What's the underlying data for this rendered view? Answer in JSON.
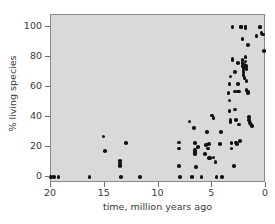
{
  "chart_data": {
    "type": "scatter",
    "title": "",
    "xlabel": "time, million years ago",
    "ylabel": "% living species",
    "xlim": [
      20,
      0
    ],
    "ylim": [
      -4,
      108
    ],
    "x_reversed": true,
    "grid": false,
    "legend": "none",
    "xticks": [
      20,
      15,
      10,
      5,
      0
    ],
    "yticks": [
      0,
      20,
      40,
      60,
      80,
      100
    ],
    "xtick_labels": [
      "20",
      "15",
      "10",
      "5",
      "0"
    ],
    "ytick_labels": [
      "0",
      "20",
      "40",
      "60",
      "80",
      "100"
    ],
    "marker": "filled-circle",
    "marker_color": "#111111",
    "plot_background": "#d9d9d9",
    "figure_background": "#ffffff",
    "points": [
      [
        20.0,
        0
      ],
      [
        19.7,
        0
      ],
      [
        19.3,
        0
      ],
      [
        16.4,
        0
      ],
      [
        15.1,
        27
      ],
      [
        15.0,
        17.5
      ],
      [
        13.6,
        10.5
      ],
      [
        13.6,
        9.0
      ],
      [
        13.6,
        7.5
      ],
      [
        13.5,
        0
      ],
      [
        13.0,
        22.5
      ],
      [
        11.7,
        0
      ],
      [
        8.1,
        23
      ],
      [
        8.1,
        19
      ],
      [
        8.1,
        7.5
      ],
      [
        8.0,
        0
      ],
      [
        7.1,
        37
      ],
      [
        6.9,
        0
      ],
      [
        6.7,
        32.5
      ],
      [
        6.6,
        22.5
      ],
      [
        6.6,
        18
      ],
      [
        6.6,
        16.5
      ],
      [
        6.6,
        15.5
      ],
      [
        6.5,
        6.5
      ],
      [
        6.3,
        20
      ],
      [
        6.0,
        0
      ],
      [
        5.7,
        15.5
      ],
      [
        5.6,
        21.5
      ],
      [
        5.5,
        30
      ],
      [
        5.4,
        19
      ],
      [
        5.3,
        22
      ],
      [
        5.3,
        12.5
      ],
      [
        5.2,
        12.5
      ],
      [
        5.0,
        41
      ],
      [
        4.9,
        39.5
      ],
      [
        4.9,
        13
      ],
      [
        4.7,
        10
      ],
      [
        4.6,
        0
      ],
      [
        4.3,
        22
      ],
      [
        4.2,
        30
      ],
      [
        4.1,
        0
      ],
      [
        3.5,
        56
      ],
      [
        3.4,
        62
      ],
      [
        3.4,
        51
      ],
      [
        3.4,
        44
      ],
      [
        3.3,
        67
      ],
      [
        3.3,
        38
      ],
      [
        3.3,
        36.5
      ],
      [
        3.2,
        22.5
      ],
      [
        3.2,
        19
      ],
      [
        3.1,
        100
      ],
      [
        3.1,
        79
      ],
      [
        3.1,
        78
      ],
      [
        3.0,
        7.5
      ],
      [
        2.9,
        70
      ],
      [
        2.9,
        57
      ],
      [
        2.9,
        45
      ],
      [
        2.8,
        38
      ],
      [
        2.8,
        23
      ],
      [
        2.7,
        22
      ],
      [
        2.6,
        76
      ],
      [
        2.6,
        62
      ],
      [
        2.6,
        57
      ],
      [
        2.5,
        57
      ],
      [
        2.5,
        35
      ],
      [
        2.4,
        24
      ],
      [
        2.3,
        100
      ],
      [
        2.3,
        100
      ],
      [
        2.2,
        92
      ],
      [
        2.2,
        78
      ],
      [
        2.2,
        76
      ],
      [
        2.2,
        74
      ],
      [
        2.1,
        72
      ],
      [
        2.1,
        70
      ],
      [
        2.1,
        68
      ],
      [
        2.0,
        75
      ],
      [
        2.0,
        73
      ],
      [
        2.0,
        66
      ],
      [
        1.9,
        100
      ],
      [
        1.9,
        100
      ],
      [
        1.9,
        99
      ],
      [
        1.9,
        80
      ],
      [
        1.9,
        77
      ],
      [
        1.8,
        74
      ],
      [
        1.8,
        72
      ],
      [
        1.8,
        64
      ],
      [
        1.8,
        58
      ],
      [
        1.7,
        88
      ],
      [
        1.7,
        57
      ],
      [
        1.7,
        56
      ],
      [
        1.6,
        40
      ],
      [
        1.6,
        38
      ],
      [
        1.5,
        36
      ],
      [
        1.4,
        35
      ],
      [
        1.3,
        34
      ],
      [
        0.9,
        94
      ],
      [
        0.6,
        100
      ],
      [
        0.5,
        100
      ],
      [
        0.4,
        96
      ],
      [
        0.3,
        95
      ],
      [
        0.2,
        84
      ]
    ]
  }
}
